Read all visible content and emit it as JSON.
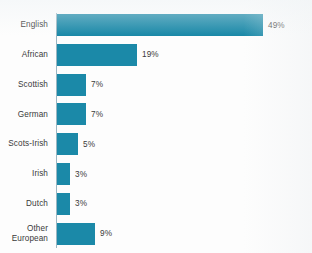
{
  "chart_data": {
    "type": "bar",
    "orientation": "horizontal",
    "title": "",
    "subtitle": "",
    "xlabel": "",
    "ylabel": "",
    "categories": [
      "English",
      "African",
      "Scottish",
      "German",
      "Scots-Irish",
      "Irish",
      "Dutch",
      "Other\nEuropean"
    ],
    "values": [
      49,
      19,
      7,
      7,
      5,
      3,
      3,
      9
    ],
    "value_labels": [
      "49%",
      "19%",
      "7%",
      "7%",
      "5%",
      "3%",
      "3%",
      "9%"
    ],
    "xlim": [
      0,
      49
    ],
    "grid": false,
    "legend": null,
    "bar_color": "#1b89a8",
    "text_color": "#3a3a3a",
    "axis_color": "#9ab6c2",
    "background": "#fdfdfd",
    "px_per_unit": 4.2,
    "bars": [
      {
        "category": "English",
        "value": 49,
        "label": "49%",
        "display_label": "English"
      },
      {
        "category": "African",
        "value": 19,
        "label": "19%",
        "display_label": "African"
      },
      {
        "category": "Scottish",
        "value": 7,
        "label": "7%",
        "display_label": "Scottish"
      },
      {
        "category": "German",
        "value": 7,
        "label": "7%",
        "display_label": "German"
      },
      {
        "category": "Scots-Irish",
        "value": 5,
        "label": "5%",
        "display_label": "Scots-Irish"
      },
      {
        "category": "Irish",
        "value": 3,
        "label": "3%",
        "display_label": "Irish"
      },
      {
        "category": "Dutch",
        "value": 3,
        "label": "3%",
        "display_label": "Dutch"
      },
      {
        "category": "Other European",
        "value": 9,
        "label": "9%",
        "display_label": "Other\nEuropean"
      }
    ]
  }
}
